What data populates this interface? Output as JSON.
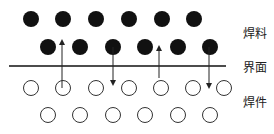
{
  "labels": {
    "solder": "焊料",
    "interface": "界面",
    "workpiece": "焊件"
  },
  "solder_rows": [
    {
      "y": 19,
      "x": [
        31,
        63,
        96,
        129,
        162,
        194
      ]
    },
    {
      "y": 47,
      "x": [
        48,
        80,
        113,
        145,
        178,
        210
      ]
    }
  ],
  "workpiece_rows": [
    {
      "y": 88,
      "x": [
        31,
        63,
        96,
        129,
        161,
        193,
        224
      ]
    },
    {
      "y": 115,
      "x": [
        48,
        80,
        113,
        145,
        178,
        210
      ]
    }
  ],
  "interface_line": {
    "y": 66,
    "x1": 9,
    "x2": 226
  },
  "arrows": [
    {
      "direction": "up",
      "x": 62,
      "y_from": 88,
      "y_to": 42
    },
    {
      "direction": "down",
      "x": 113,
      "y_from": 47,
      "y_to": 83
    },
    {
      "direction": "up",
      "x": 159,
      "y_from": 78,
      "y_to": 48
    },
    {
      "direction": "down",
      "x": 209,
      "y_from": 47,
      "y_to": 86
    }
  ],
  "colors": {
    "solder": "#111111",
    "workpiece_stroke": "#333333",
    "line": "#111111"
  }
}
